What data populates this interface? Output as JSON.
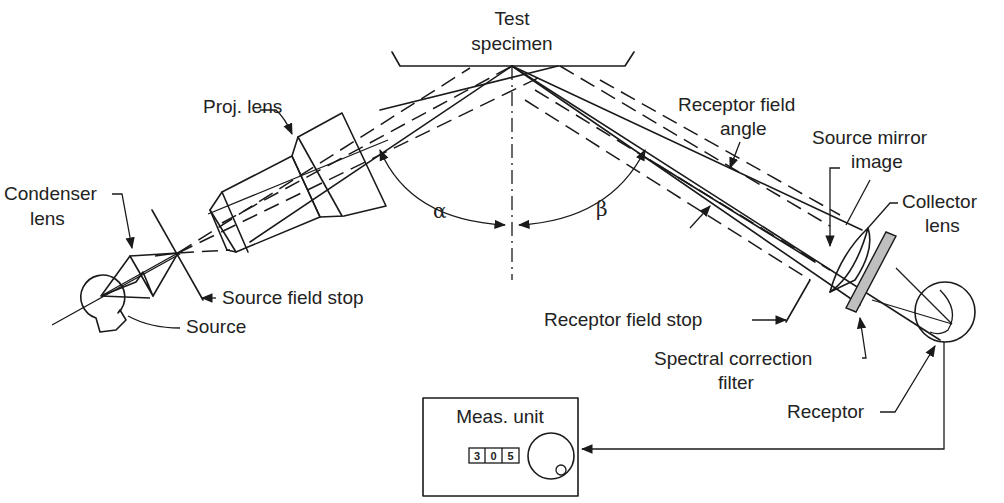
{
  "diagram": {
    "type": "goniophotometer-optical-setup",
    "labels": {
      "test_specimen": [
        "Test",
        "specimen"
      ],
      "proj_lens": "Proj. lens",
      "condenser_lens": [
        "Condenser",
        "lens"
      ],
      "source": "Source",
      "source_field_stop": "Source field stop",
      "alpha": "α",
      "beta": "β",
      "receptor_field_angle": [
        "Receptor field",
        "angle"
      ],
      "source_mirror_image": [
        "Source mirror",
        "image"
      ],
      "collector_lens": [
        "Collector",
        "lens"
      ],
      "receptor_field_stop": "Receptor field stop",
      "spectral_correction_filter": [
        "Spectral correction",
        "filter"
      ],
      "receptor": "Receptor",
      "meas_unit": "Meas. unit"
    },
    "meas_unit_display": {
      "digits": [
        "3",
        "0",
        "5"
      ]
    },
    "colors": {
      "line": "#1a1a1a",
      "filter_fill": "#bfbfbf",
      "background": "#ffffff"
    }
  }
}
